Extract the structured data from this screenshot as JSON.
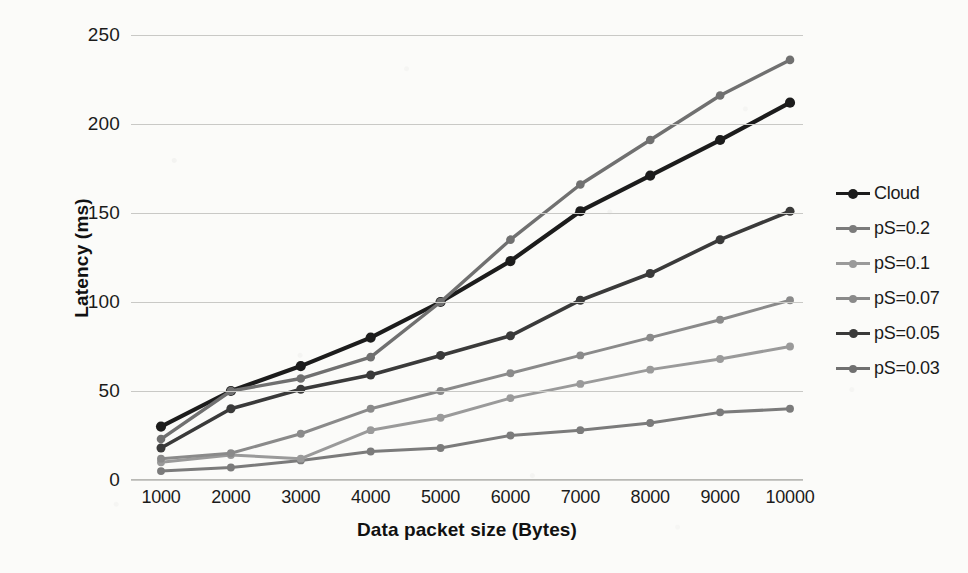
{
  "chart_data": {
    "type": "line",
    "title": "",
    "xlabel": "Data packet size (Bytes)",
    "ylabel": "Latency (ms)",
    "x": [
      1000,
      2000,
      3000,
      4000,
      5000,
      6000,
      7000,
      8000,
      9000,
      10000
    ],
    "xtick_labels": [
      "1000",
      "2000",
      "3000",
      "4000",
      "5000",
      "6000",
      "7000",
      "8000",
      "9000",
      "10000"
    ],
    "ytick_labels": [
      "0",
      "50",
      "100",
      "150",
      "200",
      "250"
    ],
    "yticks": [
      0,
      50,
      100,
      150,
      200,
      250
    ],
    "ylim": [
      0,
      250
    ],
    "xlim": [
      1000,
      10000
    ],
    "grid": "horizontal",
    "legend_position": "right",
    "markers": "circle",
    "series": [
      {
        "name": "Cloud",
        "color": "#1c1c1c",
        "width": 4.2,
        "values": [
          30,
          50,
          64,
          80,
          100,
          123,
          151,
          171,
          191,
          212
        ]
      },
      {
        "name": "pS=0.2",
        "color": "#7b7b7b",
        "width": 3.0,
        "values": [
          5,
          7,
          11,
          16,
          18,
          25,
          28,
          32,
          38,
          40
        ]
      },
      {
        "name": "pS=0.1",
        "color": "#9a9a9a",
        "width": 3.0,
        "values": [
          10,
          14,
          12,
          28,
          35,
          46,
          54,
          62,
          68,
          75
        ]
      },
      {
        "name": "pS=0.07",
        "color": "#8a8a8a",
        "width": 3.0,
        "values": [
          12,
          15,
          26,
          40,
          50,
          60,
          70,
          80,
          90,
          101
        ]
      },
      {
        "name": "pS=0.05",
        "color": "#3a3a3a",
        "width": 3.6,
        "values": [
          18,
          40,
          51,
          59,
          70,
          81,
          101,
          116,
          135,
          151
        ]
      },
      {
        "name": "pS=0.03",
        "color": "#707070",
        "width": 3.4,
        "values": [
          23,
          50,
          57,
          69,
          100,
          135,
          166,
          191,
          216,
          236
        ]
      }
    ]
  },
  "axes": {
    "y_title": "Latency (ms)",
    "x_title": "Data packet size (Bytes)"
  },
  "legend": {
    "items": [
      {
        "label": "Cloud",
        "color": "#1c1c1c"
      },
      {
        "label": "pS=0.2",
        "color": "#7b7b7b"
      },
      {
        "label": "pS=0.1",
        "color": "#9a9a9a"
      },
      {
        "label": "pS=0.07",
        "color": "#8a8a8a"
      },
      {
        "label": "pS=0.05",
        "color": "#3a3a3a"
      },
      {
        "label": "pS=0.03",
        "color": "#707070"
      }
    ]
  }
}
